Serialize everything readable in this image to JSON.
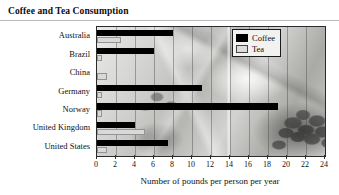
{
  "chart_data": {
    "type": "bar",
    "orientation": "horizontal",
    "title": "Coffee and Tea Consumption",
    "xlabel": "Number of pounds per person per year",
    "ylabel": "",
    "xlim": [
      0,
      24
    ],
    "xtick_labels": [
      "0",
      "2",
      "4",
      "6",
      "8",
      "10",
      "12",
      "14",
      "16",
      "18",
      "20",
      "22",
      "24"
    ],
    "xtick_values": [
      0,
      2,
      4,
      6,
      8,
      10,
      12,
      14,
      16,
      18,
      20,
      22,
      24
    ],
    "grid": "vertical",
    "legend_position": "top-right",
    "categories": [
      "Australia",
      "Brazil",
      "China",
      "Germany",
      "Norway",
      "United Kingdom",
      "United States"
    ],
    "series": [
      {
        "name": "Coffee",
        "color": "#000000",
        "values": [
          8,
          6,
          0,
          11,
          19,
          4,
          7.5
        ]
      },
      {
        "name": "Tea",
        "color": "#d9d9d9",
        "values": [
          2.5,
          0.5,
          1,
          0.5,
          0.5,
          5,
          1
        ]
      }
    ]
  },
  "legend": {
    "entries": [
      {
        "label": "Coffee",
        "swatch": "black-swatch"
      },
      {
        "label": "Tea",
        "swatch": "gray-swatch"
      }
    ]
  }
}
